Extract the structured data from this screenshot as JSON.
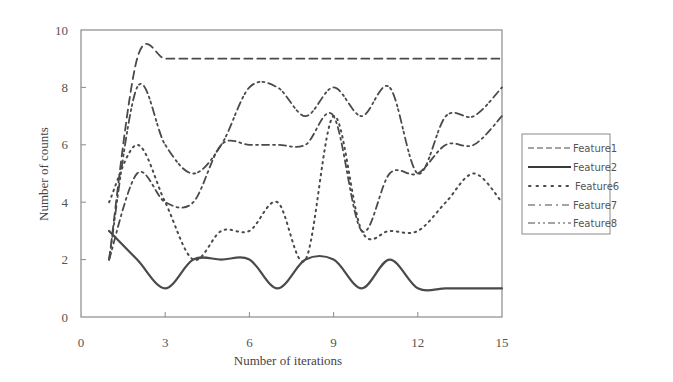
{
  "chart_data": {
    "type": "line",
    "title": "",
    "xlabel": "Number of iterations",
    "ylabel": "Number of counts",
    "xlim": [
      0,
      15
    ],
    "ylim": [
      0,
      10
    ],
    "xticks": [
      0,
      3,
      6,
      9,
      12,
      15
    ],
    "yticks": [
      0,
      2,
      4,
      6,
      8,
      10
    ],
    "grid": false,
    "legend_position": "right",
    "x": [
      1,
      2,
      3,
      4,
      5,
      6,
      7,
      8,
      9,
      10,
      11,
      12,
      13,
      14,
      15
    ],
    "series": [
      {
        "name": "Feature1",
        "style": "dashed",
        "values": [
          2,
          9,
          9,
          9,
          9,
          9,
          9,
          9,
          9,
          9,
          9,
          9,
          9,
          9,
          9
        ]
      },
      {
        "name": "Feature2",
        "style": "solid",
        "values": [
          3,
          2,
          1,
          2,
          2,
          2,
          1,
          2,
          2,
          1,
          2,
          1,
          1,
          1,
          1
        ]
      },
      {
        "name": "Feature6",
        "style": "dotted",
        "values": [
          4,
          6,
          4,
          2,
          3,
          3,
          4,
          2,
          7,
          3,
          3,
          3,
          4,
          5,
          4
        ]
      },
      {
        "name": "Feature7",
        "style": "dash-dot",
        "values": [
          2,
          5,
          4,
          4,
          6,
          6,
          6,
          6,
          7,
          3,
          5,
          5,
          6,
          6,
          7
        ]
      },
      {
        "name": "Feature8",
        "style": "dash-dot-dot",
        "values": [
          2,
          8,
          6,
          5,
          6,
          8,
          8,
          7,
          8,
          7,
          8,
          5,
          7,
          7,
          8
        ]
      }
    ]
  },
  "legend": {
    "items": [
      "Feature1",
      "Feature2",
      "Feature6",
      "Feature7",
      "Feature8"
    ]
  },
  "axes": {
    "x_title": "Number of iterations",
    "y_title": "Number of counts",
    "x_tick_labels": [
      "0",
      "3",
      "6",
      "9",
      "12",
      "15"
    ],
    "y_tick_labels": [
      "0",
      "2",
      "4",
      "6",
      "8",
      "10"
    ]
  },
  "colors": {
    "line": "#4a4a4a",
    "axis": "#8a8a8a",
    "text": "#555555"
  }
}
